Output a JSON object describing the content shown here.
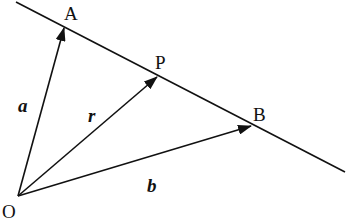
{
  "diagram": {
    "points": {
      "O": {
        "label": "O"
      },
      "A": {
        "label": "A"
      },
      "P": {
        "label": "P"
      },
      "B": {
        "label": "B"
      }
    },
    "vectors": {
      "a": {
        "label": "a",
        "from": "O",
        "to": "A"
      },
      "r": {
        "label": "r",
        "from": "O",
        "to": "P"
      },
      "b": {
        "label": "b",
        "from": "O",
        "to": "B"
      }
    },
    "line": {
      "through": [
        "A",
        "P",
        "B"
      ]
    },
    "colors": {
      "stroke": "#111111",
      "background": "#ffffff"
    }
  }
}
